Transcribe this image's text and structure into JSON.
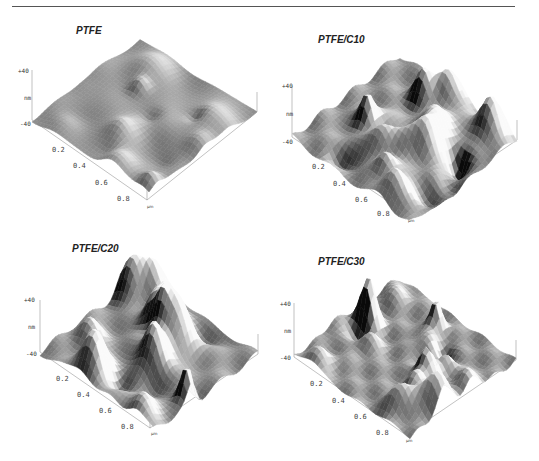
{
  "figure": {
    "rule_color": "#555555",
    "panels": [
      {
        "id": "ptfe",
        "title": "PTFE",
        "z_ticks": [
          "+40",
          "nm",
          "-40"
        ],
        "x_ticks": [
          "0.2",
          "0.4",
          "0.6",
          "0.8"
        ],
        "unit": "μm",
        "roughness": "low",
        "seed": 3,
        "amp": 0.45,
        "freq": 1.2
      },
      {
        "id": "ptfe-c10",
        "title": "PTFE/C10",
        "z_ticks": [
          "+40",
          "nm",
          "-40"
        ],
        "x_ticks": [
          "0.2",
          "0.4",
          "0.6",
          "0.8"
        ],
        "unit": "μm",
        "roughness": "high",
        "seed": 11,
        "amp": 1.0,
        "freq": 1.8
      },
      {
        "id": "ptfe-c20",
        "title": "PTFE/C20",
        "z_ticks": [
          "+40",
          "nm",
          "-40"
        ],
        "x_ticks": [
          "0.2",
          "0.4",
          "0.6",
          "0.8"
        ],
        "unit": "μm",
        "roughness": "high",
        "seed": 23,
        "amp": 1.0,
        "freq": 1.6
      },
      {
        "id": "ptfe-c30",
        "title": "PTFE/C30",
        "z_ticks": [
          "+40",
          "nm",
          "-40"
        ],
        "x_ticks": [
          "0.2",
          "0.4",
          "0.6",
          "0.8"
        ],
        "unit": "μm",
        "roughness": "medium",
        "seed": 37,
        "amp": 0.8,
        "freq": 2.2
      }
    ]
  }
}
